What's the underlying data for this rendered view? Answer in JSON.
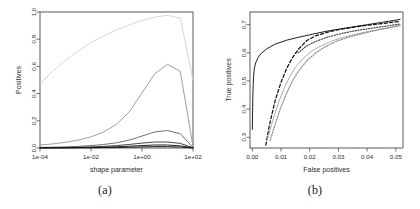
{
  "figure": {
    "panels": [
      {
        "caption": "(a)"
      },
      {
        "caption": "(b)"
      }
    ]
  },
  "chart_data": [
    {
      "type": "line",
      "panel": "(a)",
      "title": "",
      "xlabel": "shape parameter",
      "ylabel": "Positives",
      "xscale": "log",
      "xlim": [
        0.0001,
        100
      ],
      "ylim": [
        0.0,
        1.0
      ],
      "xticks": [
        0.0001,
        0.01,
        1,
        100
      ],
      "xticklabels": [
        "1e-04",
        "1e-02",
        "1e+00",
        "1e+02"
      ],
      "yticks": [
        0.0,
        0.2,
        0.4,
        0.6,
        0.8,
        1.0
      ],
      "yticklabels": [
        "0.0",
        "0.2",
        "0.4",
        "0.6",
        "0.8",
        "1.0"
      ],
      "grid": false,
      "legend": "none",
      "x": [
        0.0001,
        0.000316,
        0.001,
        0.00316,
        0.01,
        0.0316,
        0.1,
        0.316,
        1,
        3.16,
        10,
        31.6,
        100
      ],
      "series": [
        {
          "name": "curve-1",
          "color": "#d4d4d4",
          "style": "solid",
          "values": [
            0.47,
            0.565,
            0.645,
            0.715,
            0.775,
            0.825,
            0.868,
            0.905,
            0.938,
            0.963,
            0.975,
            0.955,
            0.5
          ]
        },
        {
          "name": "curve-2",
          "color": "#9a9a9a",
          "style": "solid",
          "values": [
            0.022,
            0.03,
            0.042,
            0.058,
            0.082,
            0.118,
            0.175,
            0.265,
            0.405,
            0.545,
            0.615,
            0.565,
            0.012
          ]
        },
        {
          "name": "curve-3",
          "color": "#6a6a6a",
          "style": "solid",
          "values": [
            0.004,
            0.006,
            0.008,
            0.012,
            0.018,
            0.026,
            0.038,
            0.058,
            0.088,
            0.118,
            0.128,
            0.105,
            0.004
          ]
        },
        {
          "name": "curve-4",
          "color": "#3d3d3d",
          "style": "solid",
          "values": [
            0.002,
            0.003,
            0.004,
            0.006,
            0.008,
            0.012,
            0.018,
            0.026,
            0.036,
            0.044,
            0.044,
            0.034,
            0.002
          ]
        },
        {
          "name": "curve-5",
          "color": "#1a1a1a",
          "style": "solid",
          "values": [
            0.001,
            0.0015,
            0.002,
            0.003,
            0.004,
            0.006,
            0.009,
            0.013,
            0.018,
            0.022,
            0.022,
            0.016,
            0.001
          ]
        },
        {
          "name": "curve-6",
          "color": "#111111",
          "style": "solid",
          "values": [
            0.0005,
            0.0007,
            0.001,
            0.0014,
            0.002,
            0.003,
            0.004,
            0.006,
            0.008,
            0.01,
            0.01,
            0.007,
            0.0005
          ]
        }
      ]
    },
    {
      "type": "line",
      "panel": "(b)",
      "title": "",
      "xlabel": "False positives",
      "ylabel": "True positives",
      "xscale": "linear",
      "xlim": [
        -0.0008,
        0.0525
      ],
      "ylim": [
        0.262,
        0.745
      ],
      "xticks": [
        0.0,
        0.01,
        0.02,
        0.03,
        0.04,
        0.05
      ],
      "xticklabels": [
        "0.00",
        "0.01",
        "0.02",
        "0.03",
        "0.04",
        "0.05"
      ],
      "yticks": [
        0.3,
        0.4,
        0.5,
        0.6,
        0.7
      ],
      "yticklabels": [
        "0.3",
        "0.4",
        "0.5",
        "0.6",
        "0.7"
      ],
      "grid": false,
      "legend": "none",
      "series": [
        {
          "name": "roc-solid-black",
          "color": "#111111",
          "style": "solid",
          "x": [
            0.0,
            0.0002,
            0.0004,
            0.0007,
            0.0012,
            0.002,
            0.003,
            0.005,
            0.008,
            0.012,
            0.016,
            0.02,
            0.025,
            0.03,
            0.035,
            0.04,
            0.045,
            0.05,
            0.0515
          ],
          "y": [
            0.328,
            0.45,
            0.51,
            0.545,
            0.565,
            0.583,
            0.597,
            0.614,
            0.631,
            0.645,
            0.655,
            0.664,
            0.675,
            0.684,
            0.692,
            0.7,
            0.708,
            0.716,
            0.719
          ]
        },
        {
          "name": "roc-dashed-black",
          "color": "#111111",
          "style": "dashed",
          "x": [
            0.0047,
            0.006,
            0.008,
            0.01,
            0.012,
            0.014,
            0.016,
            0.019,
            0.022,
            0.026,
            0.03,
            0.034,
            0.038,
            0.042,
            0.046,
            0.05,
            0.0515
          ],
          "y": [
            0.272,
            0.345,
            0.432,
            0.495,
            0.545,
            0.583,
            0.612,
            0.644,
            0.66,
            0.673,
            0.682,
            0.689,
            0.695,
            0.7,
            0.705,
            0.71,
            0.712
          ]
        },
        {
          "name": "roc-solid-gray",
          "color": "#a8a8a8",
          "style": "solid",
          "x": [
            0.0053,
            0.007,
            0.009,
            0.011,
            0.013,
            0.015,
            0.018,
            0.021,
            0.024,
            0.028,
            0.032,
            0.036,
            0.04,
            0.044,
            0.048,
            0.0515
          ],
          "y": [
            0.295,
            0.355,
            0.42,
            0.472,
            0.515,
            0.548,
            0.583,
            0.608,
            0.625,
            0.643,
            0.656,
            0.666,
            0.675,
            0.683,
            0.69,
            0.696
          ]
        },
        {
          "name": "roc-dotted-gray",
          "color": "#8c8c8c",
          "style": "dotted",
          "x": [
            0.0062,
            0.008,
            0.01,
            0.012,
            0.014,
            0.016,
            0.019,
            0.022,
            0.025,
            0.029,
            0.033,
            0.037,
            0.041,
            0.045,
            0.049,
            0.0515
          ],
          "y": [
            0.288,
            0.348,
            0.408,
            0.458,
            0.5,
            0.534,
            0.572,
            0.599,
            0.619,
            0.64,
            0.654,
            0.665,
            0.675,
            0.684,
            0.692,
            0.698
          ]
        },
        {
          "name": "roc-dotted-dark",
          "color": "#4f4f4f",
          "style": "dotted",
          "x": [
            0.016,
            0.019,
            0.022,
            0.026,
            0.03,
            0.034,
            0.038,
            0.042,
            0.046,
            0.05,
            0.0515
          ],
          "y": [
            0.6,
            0.625,
            0.64,
            0.655,
            0.666,
            0.675,
            0.682,
            0.688,
            0.694,
            0.7,
            0.702
          ]
        }
      ]
    }
  ]
}
